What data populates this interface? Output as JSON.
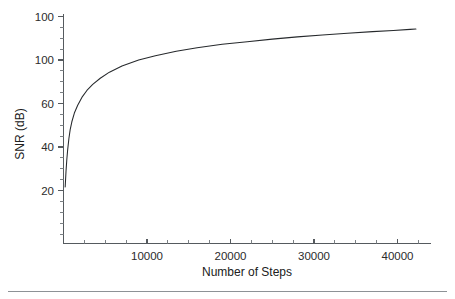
{
  "chart_data": {
    "type": "line",
    "title": "",
    "subtitle": "",
    "xlabel": "Number of Steps",
    "ylabel": "SNR (dB)",
    "xlim": [
      0,
      44000
    ],
    "ylim": [
      0,
      122
    ],
    "grid": false,
    "legend": null,
    "x_ticks": [
      10000,
      20000,
      30000,
      40000
    ],
    "x_tick_labels": [
      "10000",
      "20000",
      "30000",
      "40000"
    ],
    "x_minor_tick_interval": 2500,
    "y_ticks": [
      20,
      40,
      60,
      100,
      120
    ],
    "y_tick_labels": [
      "20",
      "40",
      "60",
      "100",
      "100"
    ],
    "y_minor_tick_interval": 5,
    "series": [
      {
        "name": "SNR",
        "x": [
          200,
          300,
          400,
          500,
          650,
          800,
          1000,
          1300,
          1700,
          2200,
          2800,
          3500,
          4400,
          5500,
          7000,
          9000,
          11000,
          13500,
          16000,
          19000,
          22000,
          25000,
          28000,
          31000,
          34000,
          37000,
          39500,
          41500,
          42200
        ],
        "y": [
          22.0,
          31.0,
          38.0,
          43.5,
          50.0,
          55.0,
          59.5,
          64.5,
          69.0,
          73.5,
          77.5,
          81.0,
          84.5,
          88.0,
          91.5,
          95.0,
          97.5,
          100.0,
          102.0,
          104.0,
          105.5,
          107.0,
          108.3,
          109.4,
          110.4,
          111.3,
          112.0,
          112.6,
          112.8
        ]
      }
    ]
  },
  "axes": {
    "y_axis_title": "SNR (dB)",
    "x_axis_title": "Number of Steps"
  }
}
